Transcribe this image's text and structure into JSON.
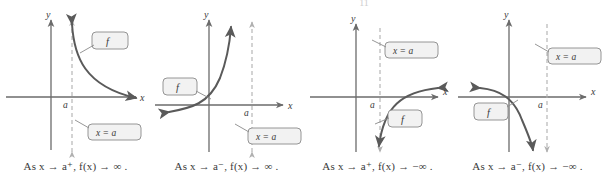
{
  "figure": {
    "type": "math-diagram",
    "top_artifact": "11",
    "colors": {
      "axis": "#6b6b6b",
      "curve": "#5a5a5a",
      "asymptote": "#b0b0b0",
      "callout_fill": "#f2f2f2",
      "callout_stroke": "#8a8a8a",
      "text": "#3a3a3a"
    }
  },
  "panels": [
    {
      "id": "panel-1",
      "axis_labels": {
        "x": "x",
        "y": "y"
      },
      "tick_label": "a",
      "asymptote_label": "x = a",
      "function_label": "f",
      "caption": "As x → a⁺, f(x) → ∞ .",
      "caption_parts": {
        "lead": "As",
        "variable": "x",
        "arrow": "→",
        "approach": "a",
        "side": "+",
        "function": "f(x)",
        "limit": "∞"
      },
      "curve": {
        "branch": "right",
        "direction": "up",
        "path": "M 72 24 C 74 56, 84 86, 136 98"
      },
      "asymptote_arrows": {
        "top": true,
        "bottom": true
      },
      "callout_f": {
        "x": 96,
        "y": 32,
        "w": 28,
        "h": 17
      },
      "callout_asym": {
        "x": 92,
        "y": 124,
        "w": 45,
        "h": 16
      }
    },
    {
      "id": "panel-2",
      "axis_labels": {
        "x": "x",
        "y": "y"
      },
      "tick_label": "a",
      "asymptote_label": "x = a",
      "function_label": "f",
      "caption": "As x → a⁻, f(x) → ∞ .",
      "caption_parts": {
        "lead": "As",
        "variable": "x",
        "arrow": "→",
        "approach": "a",
        "side": "−",
        "function": "f(x)",
        "limit": "∞"
      },
      "curve": {
        "branch": "left",
        "direction": "up",
        "path": "M 18 104 C 40 101, 58 98, 69 74 C 76 58, 78 40, 79 26"
      },
      "asymptote_arrows": {
        "top": true,
        "bottom": true
      },
      "callout_f": {
        "x": 16,
        "y": 78,
        "w": 26,
        "h": 17
      },
      "callout_asym": {
        "x": 101,
        "y": 128,
        "w": 45,
        "h": 16
      }
    },
    {
      "id": "panel-3",
      "axis_labels": {
        "x": "x",
        "y": "y"
      },
      "tick_label": "a",
      "asymptote_label": "x = a",
      "function_label": "f",
      "caption": "As x → a⁺, f(x) → −∞ .",
      "caption_parts": {
        "lead": "As",
        "variable": "x",
        "arrow": "→",
        "approach": "a",
        "side": "+",
        "function": "f(x)",
        "limit": "−∞"
      },
      "curve": {
        "branch": "right",
        "direction": "down",
        "path": "M 136 88 C 98 92, 78 106, 72 142"
      },
      "asymptote_arrows": {
        "top": false,
        "bottom": true
      },
      "callout_f": {
        "x": 90,
        "y": 110,
        "w": 26,
        "h": 17
      },
      "callout_asym": {
        "x": 87,
        "y": 42,
        "w": 45,
        "h": 16
      }
    },
    {
      "id": "panel-4",
      "axis_labels": {
        "x": "x",
        "y": "y"
      },
      "tick_label": "a",
      "asymptote_label": "x = a",
      "function_label": "f",
      "caption": "As x → a⁻, f(x) → −∞ .",
      "caption_parts": {
        "lead": "As",
        "variable": "x",
        "arrow": "→",
        "approach": "a",
        "side": "−",
        "function": "f(x)",
        "limit": "−∞"
      },
      "curve": {
        "branch": "left",
        "direction": "down",
        "path": "M 28 88 C 48 90, 62 96, 70 118 C 75 132, 78 142, 79 150"
      },
      "asymptote_arrows": {
        "top": true,
        "bottom": true
      },
      "callout_f": {
        "x": 26,
        "y": 103,
        "w": 26,
        "h": 17
      },
      "callout_asym": {
        "x": 100,
        "y": 48,
        "w": 45,
        "h": 16
      }
    }
  ]
}
